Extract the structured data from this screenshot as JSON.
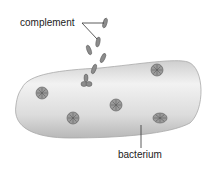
{
  "labels": {
    "complement": "complement",
    "bacterium": "bacterium"
  },
  "colors": {
    "bacterium_fill": "#d9d9d9",
    "bacterium_edge": "#9a9a9a",
    "particle": "#8a8a8a",
    "pore": "#6e6e6e",
    "line": "#333333"
  },
  "pores": [
    {
      "x": 42,
      "y": 93
    },
    {
      "x": 73,
      "y": 118
    },
    {
      "x": 116,
      "y": 105
    },
    {
      "x": 157,
      "y": 70
    },
    {
      "x": 160,
      "y": 118
    }
  ]
}
